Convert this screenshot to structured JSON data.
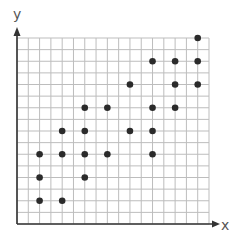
{
  "chart_data": {
    "type": "scatter",
    "title": "",
    "xlabel": "x",
    "ylabel": "y",
    "xlim": [
      0,
      17
    ],
    "ylim": [
      0,
      16
    ],
    "grid": true,
    "legend": null,
    "tick_labels": false,
    "points": [
      {
        "x": 2,
        "y": 2
      },
      {
        "x": 2,
        "y": 4
      },
      {
        "x": 2,
        "y": 6
      },
      {
        "x": 4,
        "y": 2
      },
      {
        "x": 4,
        "y": 6
      },
      {
        "x": 4,
        "y": 8
      },
      {
        "x": 6,
        "y": 4
      },
      {
        "x": 6,
        "y": 6
      },
      {
        "x": 6,
        "y": 8
      },
      {
        "x": 6,
        "y": 10
      },
      {
        "x": 8,
        "y": 6
      },
      {
        "x": 8,
        "y": 10
      },
      {
        "x": 10,
        "y": 8
      },
      {
        "x": 10,
        "y": 12
      },
      {
        "x": 12,
        "y": 6
      },
      {
        "x": 12,
        "y": 8
      },
      {
        "x": 12,
        "y": 10
      },
      {
        "x": 12,
        "y": 14
      },
      {
        "x": 14,
        "y": 10
      },
      {
        "x": 14,
        "y": 12
      },
      {
        "x": 14,
        "y": 14
      },
      {
        "x": 16,
        "y": 12
      },
      {
        "x": 16,
        "y": 14
      },
      {
        "x": 16,
        "y": 16
      }
    ]
  },
  "colors": {
    "grid": "#bdbdbd",
    "axis": "#333333",
    "point": "#2b2b2b",
    "label": "#555555"
  }
}
